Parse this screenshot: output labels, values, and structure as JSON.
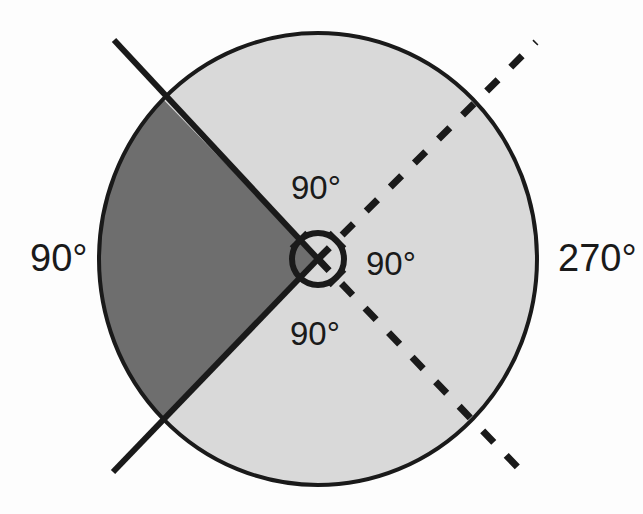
{
  "figure": {
    "background_color": "#fdfdfd"
  },
  "colors": {
    "stroke": "#1a1a1a",
    "dark_sector_fill": "#6e6e6e",
    "light_sector_fill": "#d9d9d9",
    "label_color": "#1a1a1a",
    "page_background": "#fdfdfd"
  },
  "circle": {
    "center_x": 318,
    "center_y": 259,
    "radius_x": 219,
    "radius_y": 226,
    "outline_width": 4
  },
  "center_arc": {
    "radius": 26,
    "stroke_width": 6,
    "description": "small circular angle marker at center with tick marks on each ray"
  },
  "sectors": [
    {
      "name": "dark-sector",
      "fill": "#6e6e6e",
      "start_angle_deg": 135,
      "end_angle_deg": 225,
      "sweep_deg": 90,
      "label": "90°"
    },
    {
      "name": "light-sector",
      "fill": "#d9d9d9",
      "start_angle_deg": 225,
      "end_angle_deg": 135,
      "sweep_deg": 270,
      "label": "270°"
    }
  ],
  "rays": [
    {
      "name": "solid-ray-upper-left",
      "style": "solid",
      "angle_deg": 135,
      "x1": 318,
      "y1": 259,
      "x2": 114,
      "y2": 40,
      "stroke_width": 6
    },
    {
      "name": "solid-ray-lower-left",
      "style": "solid",
      "angle_deg": 225,
      "x1": 318,
      "y1": 259,
      "x2": 113,
      "y2": 472,
      "stroke_width": 6
    },
    {
      "name": "dashed-ray-upper-right",
      "style": "dashed",
      "angle_deg": 45,
      "x1": 318,
      "y1": 259,
      "x2": 536,
      "y2": 42,
      "stroke_width": 7,
      "dash_pattern": "16 18"
    },
    {
      "name": "dashed-ray-lower-right",
      "style": "dashed",
      "angle_deg": 315,
      "x1": 318,
      "y1": 259,
      "x2": 526,
      "y2": 476,
      "stroke_width": 7,
      "dash_pattern": "16 18"
    }
  ],
  "labels": {
    "outer_left": {
      "text": "90°",
      "x": 30,
      "y": 271,
      "anchor": "start",
      "describes": "dark sector measure"
    },
    "outer_right": {
      "text": "270°",
      "x": 558,
      "y": 271,
      "anchor": "start",
      "describes": "light sector measure"
    },
    "inner_top": {
      "text": "90°",
      "x": 291,
      "y": 199,
      "anchor": "start",
      "describes": "angle between solid upper-left ray and dashed upper-right ray"
    },
    "inner_right": {
      "text": "90°",
      "x": 366,
      "y": 275,
      "anchor": "start",
      "describes": "angle between dashed upper-right ray and dashed lower-right ray"
    },
    "inner_bottom": {
      "text": "90°",
      "x": 290,
      "y": 345,
      "anchor": "start",
      "describes": "angle between dashed lower-right ray and solid lower-left ray"
    }
  },
  "tick_marks": [
    {
      "name": "tick-on-solid-upper-left-ray",
      "angle_deg": 135
    },
    {
      "name": "tick-on-dashed-upper-right-ray",
      "angle_deg": 45
    },
    {
      "name": "tick-on-dashed-lower-right-ray",
      "angle_deg": 315
    }
  ]
}
